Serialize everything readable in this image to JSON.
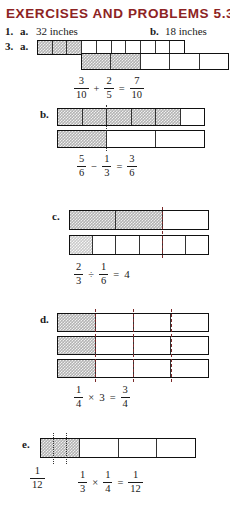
{
  "header": {
    "title": "EXERCISES AND PROBLEMS 5.3",
    "title_color": "#8d2323"
  },
  "answers": {
    "number": "1.",
    "a_label": "a.",
    "a_value": "32 inches",
    "b_label": "b.",
    "b_value": "18 inches"
  },
  "problem": {
    "number": "3.",
    "parts": [
      {
        "label": "a.",
        "bars": [
          {
            "cells": 10,
            "shaded": 3
          },
          {
            "cells": 5,
            "shaded": 2
          }
        ],
        "equation": {
          "terms": [
            {
              "type": "fraction",
              "n": "3",
              "d": "10"
            },
            {
              "type": "op",
              "text": "+"
            },
            {
              "type": "fraction",
              "n": "2",
              "d": "5"
            },
            {
              "type": "op",
              "text": "="
            },
            {
              "type": "fraction",
              "n": "7",
              "d": "10"
            }
          ]
        }
      },
      {
        "label": "b.",
        "bars": [
          {
            "cells": 6,
            "shaded": 5
          },
          {
            "cells": 3,
            "shaded": 1
          }
        ],
        "equation": {
          "terms": [
            {
              "type": "fraction",
              "n": "5",
              "d": "6"
            },
            {
              "type": "op",
              "text": "−"
            },
            {
              "type": "fraction",
              "n": "1",
              "d": "3"
            },
            {
              "type": "op",
              "text": "="
            },
            {
              "type": "fraction",
              "n": "3",
              "d": "6"
            }
          ]
        }
      },
      {
        "label": "c.",
        "bars": [
          {
            "cells": 3,
            "shaded": 2
          },
          {
            "cells": 6,
            "shaded": 1
          }
        ],
        "equation": {
          "terms": [
            {
              "type": "fraction",
              "n": "2",
              "d": "3"
            },
            {
              "type": "op",
              "text": "÷"
            },
            {
              "type": "fraction",
              "n": "1",
              "d": "6"
            },
            {
              "type": "op",
              "text": "="
            },
            {
              "type": "whole",
              "text": "4"
            }
          ]
        }
      },
      {
        "label": "d.",
        "bars": [
          {
            "cells": 4,
            "shaded": 1
          },
          {
            "cells": 4,
            "shaded": 1
          },
          {
            "cells": 4,
            "shaded": 1
          }
        ],
        "equation": {
          "terms": [
            {
              "type": "fraction",
              "n": "1",
              "d": "4"
            },
            {
              "type": "op",
              "text": "×"
            },
            {
              "type": "whole",
              "text": "3"
            },
            {
              "type": "op",
              "text": "="
            },
            {
              "type": "fraction",
              "n": "3",
              "d": "4"
            }
          ]
        }
      },
      {
        "label": "e.",
        "bars": [
          {
            "cells": 4,
            "shaded": 1
          }
        ],
        "side_label": {
          "n": "1",
          "d": "12"
        },
        "equation": {
          "terms": [
            {
              "type": "fraction",
              "n": "1",
              "d": "3"
            },
            {
              "type": "op",
              "text": "×"
            },
            {
              "type": "fraction",
              "n": "1",
              "d": "4"
            },
            {
              "type": "op",
              "text": "="
            },
            {
              "type": "fraction",
              "n": "1",
              "d": "12"
            }
          ]
        }
      }
    ]
  }
}
